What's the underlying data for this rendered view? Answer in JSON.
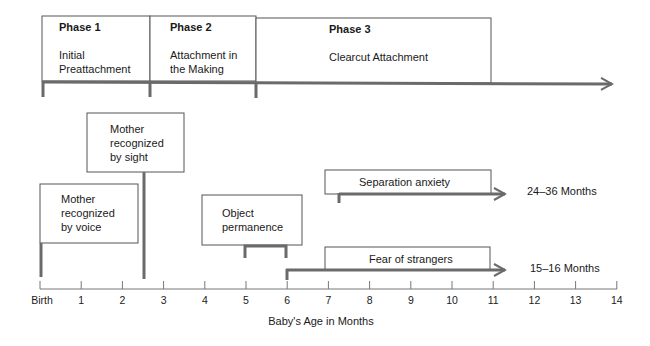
{
  "phases": [
    {
      "title": "Phase 1",
      "line1": "Initial",
      "line2": "Preattachment"
    },
    {
      "title": "Phase 2",
      "line1": "Attachment in",
      "line2": "the Making"
    },
    {
      "title": "Phase 3",
      "line1": "Clearcut Attachment",
      "line2": ""
    }
  ],
  "milestones": {
    "voice": {
      "line1": "Mother",
      "line2": "recognized",
      "line3": "by voice"
    },
    "sight": {
      "line1": "Mother",
      "line2": "recognized",
      "line3": "by sight"
    },
    "object": {
      "line1": "Object",
      "line2": "permanence"
    },
    "separation": {
      "label": "Separation anxiety",
      "range": "24–36 Months"
    },
    "strangers": {
      "label": "Fear of strangers",
      "range": "15–16 Months"
    }
  },
  "axis": {
    "title": "Baby's Age  in Months",
    "ticks": [
      "Birth",
      "1",
      "2",
      "3",
      "4",
      "5",
      "6",
      "7",
      "8",
      "9",
      "10",
      "11",
      "12",
      "13",
      "14"
    ]
  }
}
